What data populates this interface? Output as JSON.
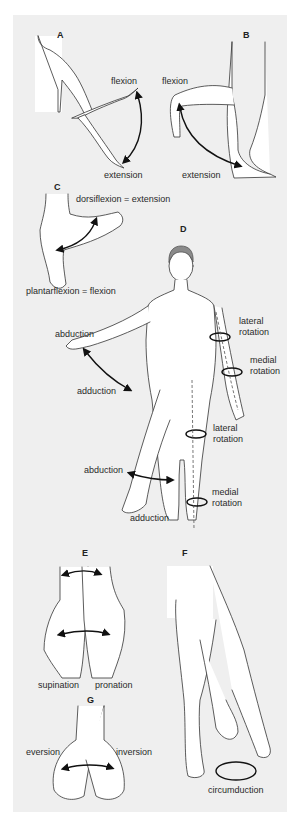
{
  "figure": {
    "background": "#efefef",
    "line_color": "#222222",
    "skin_fill": "#ffffff",
    "hair_color": "#8a8a8a"
  },
  "panels": {
    "A": {
      "letter": "A",
      "labels": {
        "flexion": "flexion",
        "extension": "extension"
      }
    },
    "B": {
      "letter": "B",
      "labels": {
        "flexion": "flexion",
        "extension": "extension"
      }
    },
    "C": {
      "letter": "C",
      "labels": {
        "dorsiflexion": "dorsiflexion = extension",
        "plantarflexion": "plantarflexion = flexion"
      }
    },
    "D": {
      "letter": "D",
      "labels": {
        "arm_abduction": "abduction",
        "arm_adduction": "adduction",
        "arm_lateral_1": "lateral",
        "arm_lateral_2": "rotation",
        "arm_medial_1": "medial",
        "arm_medial_2": "rotation",
        "leg_lateral_1": "lateral",
        "leg_lateral_2": "rotation",
        "leg_abduction": "abduction",
        "leg_medial_1": "medial",
        "leg_medial_2": "rotation",
        "leg_adduction": "adduction"
      }
    },
    "E": {
      "letter": "E",
      "labels": {
        "supination": "supination",
        "pronation": "pronation"
      }
    },
    "F": {
      "letter": "F",
      "labels": {
        "circumduction": "circumduction"
      }
    },
    "G": {
      "letter": "G",
      "labels": {
        "eversion": "eversion",
        "inversion": "inversion"
      }
    }
  }
}
